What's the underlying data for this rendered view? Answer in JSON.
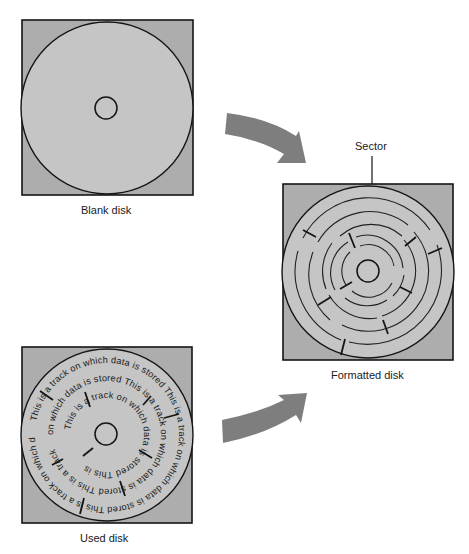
{
  "figure": {
    "colors": {
      "square_fill": "#adadad",
      "disk_fill": "#c5c5c5",
      "line": "#151515",
      "arrow": "#7e7e7e",
      "background": "#ffffff"
    },
    "blank_disk": {
      "label": "Blank disk"
    },
    "formatted_disk": {
      "label": "Formatted disk",
      "callout": "Sector",
      "track_count": 5,
      "sector_marks": 10
    },
    "used_disk": {
      "label": "Used disk",
      "track_text": "This is a track on which data is stored",
      "tracks": [
        {
          "name": "outer",
          "text": "This is a track on which data is stored This is a track on which data is stored This is a track on which data is"
        },
        {
          "name": "middle",
          "text": "on which data is stored This is a track on which data is stored This is a track"
        },
        {
          "name": "inner",
          "text": "This is a track on which data is stored This is"
        }
      ]
    },
    "arrows": [
      {
        "name": "blank-to-formatted",
        "direction": "down-right"
      },
      {
        "name": "used-to-formatted",
        "direction": "up-right"
      }
    ]
  }
}
